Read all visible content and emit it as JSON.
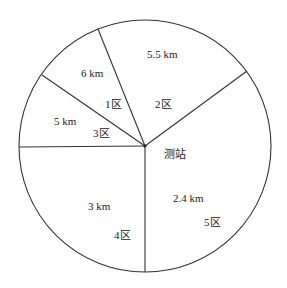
{
  "diagram": {
    "type": "sector-map",
    "center_label": "测站",
    "circle": {
      "cx": 145,
      "cy": 146,
      "r": 126
    },
    "colors": {
      "line": "#333333",
      "text": "#222222",
      "background": "#ffffff"
    },
    "sectors": [
      {
        "zone": "1区",
        "distance": "6 km"
      },
      {
        "zone": "2区",
        "distance": "5.5 km"
      },
      {
        "zone": "3区",
        "distance": "5 km"
      },
      {
        "zone": "4区",
        "distance": "3 km"
      },
      {
        "zone": "5区",
        "distance": "2.4 km"
      }
    ]
  }
}
